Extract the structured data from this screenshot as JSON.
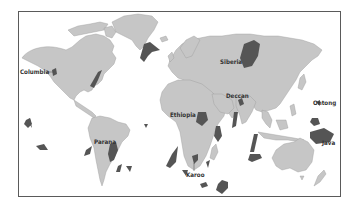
{
  "map": {
    "title": "",
    "description": "World map of large igneous provinces (flood basalts)",
    "colors": {
      "land": "#c6c6c6",
      "province": "#555555",
      "ocean": "#ffffff",
      "frame": "#5a5a5a",
      "label": "#333333"
    },
    "labels": {
      "columbia": "Columbia",
      "siberia": "Siberia",
      "deccan": "Deccan",
      "ontong": "Ontong",
      "java": "Java",
      "ethiopia": "Ethiopia",
      "parana": "Parana",
      "karoo": "Karoo"
    }
  }
}
